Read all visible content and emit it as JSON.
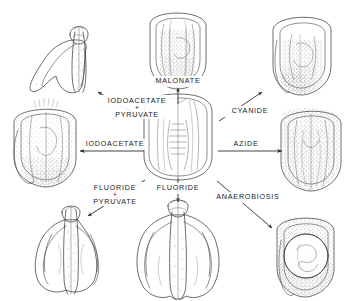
{
  "figure": {
    "type": "radial-treatment-diagram",
    "background_color": "#ffffff",
    "ink_color": "#1a1a1a",
    "center": {
      "name": "control-embryo",
      "caption": "",
      "description": "untreated control neurula, dorsal view"
    },
    "treatments": [
      {
        "id": "iodoacetate-pyruvate",
        "label_lines": [
          "IODOACETATE",
          "PYRUVATE"
        ],
        "connector": "+",
        "direction": "up-left",
        "arrow": "diagonal",
        "result_embryo": "elongated-larva-left-top"
      },
      {
        "id": "malonate",
        "label_lines": [
          "MALONATE"
        ],
        "connector": "",
        "direction": "up",
        "arrow": "vertical",
        "result_embryo": "rounded-embryo-top"
      },
      {
        "id": "cyanide",
        "label_lines": [
          "CYANIDE"
        ],
        "connector": "",
        "direction": "up-right",
        "arrow": "diagonal",
        "result_embryo": "rounded-embryo-top-right"
      },
      {
        "id": "iodoacetate",
        "label_lines": [
          "IODOACETATE"
        ],
        "connector": "",
        "direction": "left",
        "arrow": "horizontal",
        "result_embryo": "rounded-embryo-left"
      },
      {
        "id": "azide",
        "label_lines": [
          "AZIDE"
        ],
        "connector": "",
        "direction": "right",
        "arrow": "horizontal",
        "result_embryo": "rounded-embryo-right"
      },
      {
        "id": "fluoride-pyruvate",
        "label_lines": [
          "FLUORIDE",
          "PYRUVATE"
        ],
        "connector": "+",
        "direction": "down-left",
        "arrow": "diagonal",
        "result_embryo": "elongated-larva-left-bottom"
      },
      {
        "id": "fluoride",
        "label_lines": [
          "FLUORIDE"
        ],
        "connector": "",
        "direction": "down",
        "arrow": "vertical",
        "result_embryo": "elongated-larva-bottom"
      },
      {
        "id": "anaerobiosis",
        "label_lines": [
          "ANAEROBIOSIS"
        ],
        "connector": "",
        "direction": "down-right",
        "arrow": "diagonal",
        "result_embryo": "rounded-embryo-bottom-right"
      }
    ]
  }
}
